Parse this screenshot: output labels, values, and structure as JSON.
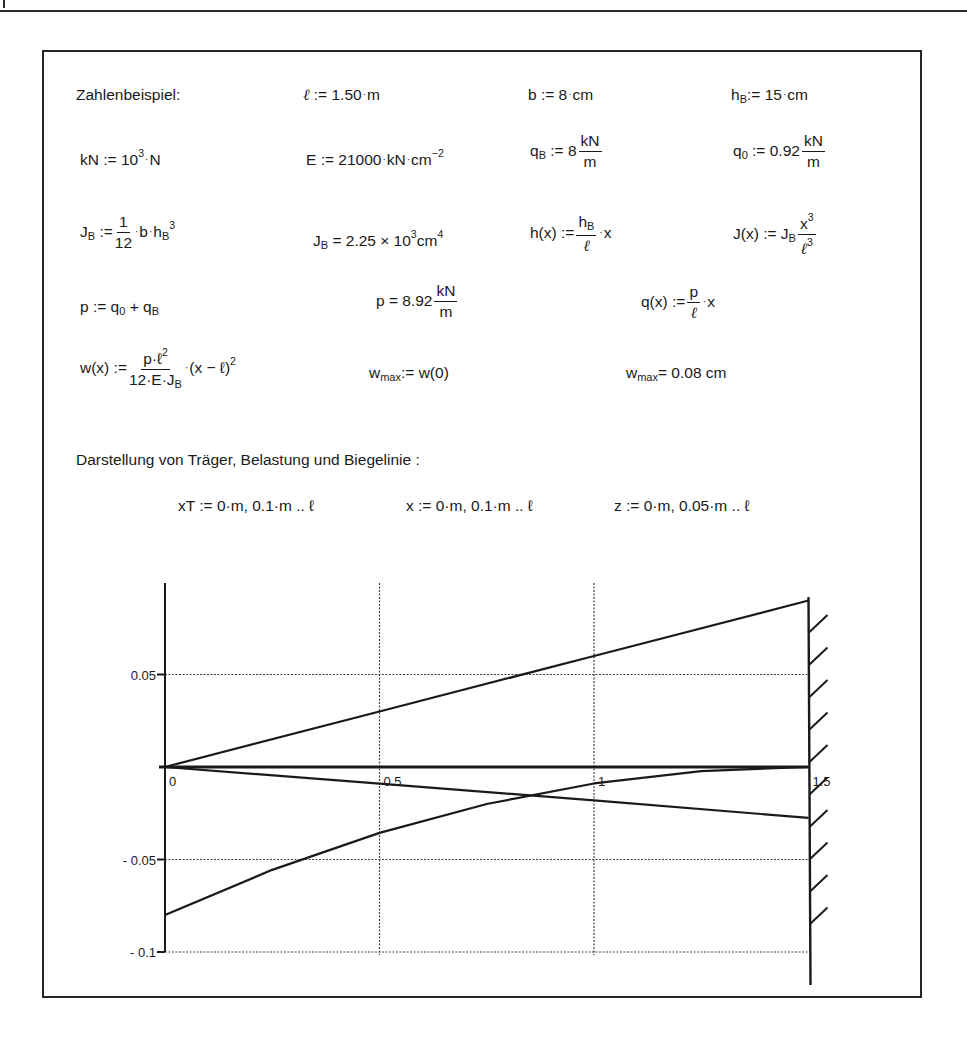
{
  "page": {
    "section_title": "Zahlenbeispiel:",
    "plot_heading": "Darstellung von Träger, Belastung und Biegelinie :"
  },
  "definitions": {
    "ell": {
      "lhs": "ℓ",
      "op": ":=",
      "value": "1.50",
      "unit": "m"
    },
    "b": {
      "lhs": "b",
      "op": ":=",
      "value": "8",
      "unit": "cm"
    },
    "hB": {
      "lhs": "h",
      "sub": "B",
      "op": ":=",
      "value": "15",
      "unit": "cm"
    },
    "kN": {
      "lhs": "kN",
      "op": ":=",
      "base": "10",
      "exp": "3",
      "unit": "N"
    },
    "E": {
      "lhs": "E",
      "op": ":=",
      "value": "21000",
      "unit": "kN",
      "unit2": "cm",
      "unit2_exp": "−2"
    },
    "qB": {
      "lhs": "q",
      "sub": "B",
      "op": ":=",
      "value": "8",
      "num": "kN",
      "den": "m"
    },
    "q0": {
      "lhs": "q",
      "sub": "0",
      "op": ":=",
      "value": "0.92",
      "num": "kN",
      "den": "m"
    },
    "JB_def": {
      "lhs": "J",
      "sub": "B",
      "op": ":=",
      "num": "1",
      "den": "12",
      "rest_b": "b",
      "rest_h": "h",
      "rest_sub": "B",
      "rest_exp": "3"
    },
    "JB_res": {
      "lhs": "J",
      "sub": "B",
      "op": "=",
      "value": "2.25 × 10",
      "exp": "3",
      "unit": "cm",
      "unit_exp": "4"
    },
    "h_x": {
      "lhs": "h(x)",
      "op": ":=",
      "num": "h",
      "num_sub": "B",
      "den": "ℓ",
      "tail": "x"
    },
    "J_x": {
      "lhs": "J(x)",
      "op": ":=",
      "pre": "J",
      "pre_sub": "B",
      "num": "x",
      "num_exp": "3",
      "den": "ℓ",
      "den_exp": "3"
    },
    "p_def": {
      "lhs": "p",
      "op": ":=",
      "rhs": "q",
      "rhs_sub1": "0",
      "plus": "+",
      "rhs2": "q",
      "rhs_sub2": "B"
    },
    "p_res": {
      "lhs": "p",
      "op": "=",
      "value": "8.92",
      "num": "kN",
      "den": "m"
    },
    "q_x": {
      "lhs": "q(x)",
      "op": ":=",
      "num": "p",
      "den": "ℓ",
      "tail": "x"
    },
    "w_x": {
      "lhs": "w(x)",
      "op": ":=",
      "num": "p·ℓ",
      "num_exp": "2",
      "den": "12·E·J",
      "den_sub": "B",
      "tail": "(x − ℓ)",
      "tail_exp": "2"
    },
    "wmax_def": {
      "lhs": "w",
      "sub": "max",
      "op": ":=",
      "rhs": "w(0)"
    },
    "wmax_res": {
      "lhs": "w",
      "sub": "max",
      "op": "=",
      "value": "0.08",
      "unit": "cm"
    },
    "ranges": [
      {
        "text": "xT := 0·m, 0.1·m .. ℓ"
      },
      {
        "text": "x := 0·m, 0.1·m .. ℓ"
      },
      {
        "text": "z := 0·m, 0.05·m .. ℓ"
      }
    ]
  },
  "chart_data": {
    "type": "line",
    "title": "",
    "xlabel": "",
    "ylabel": "",
    "xlim": [
      0,
      1.5
    ],
    "ylim": [
      -0.1,
      0.1
    ],
    "x_ticks": [
      0,
      0.5,
      1,
      1.5
    ],
    "x_tick_labels": [
      "0",
      "0.5",
      "1",
      "1.5"
    ],
    "y_ticks": [
      0.05,
      -0.05,
      -0.1
    ],
    "y_tick_labels": [
      "0.05",
      "- 0.05",
      "- 0.1"
    ],
    "grid": true,
    "grid_style": "dotted",
    "series": [
      {
        "name": "beam-top (h(x) scaled)",
        "x": [
          0,
          0.5,
          1.0,
          1.5
        ],
        "y": [
          0,
          0.03,
          0.06,
          0.09
        ]
      },
      {
        "name": "beam-axis",
        "x": [
          0,
          1.5
        ],
        "y": [
          0,
          0
        ]
      },
      {
        "name": "load q(x) scaled",
        "x": [
          0,
          0.5,
          1.0,
          1.5
        ],
        "y": [
          0,
          -0.009,
          -0.018,
          -0.0275
        ]
      },
      {
        "name": "deflection -w(x)",
        "x": [
          0,
          0.25,
          0.5,
          0.75,
          1.0,
          1.25,
          1.5
        ],
        "y": [
          -0.08,
          -0.0556,
          -0.0356,
          -0.02,
          -0.0089,
          -0.0022,
          0
        ]
      }
    ],
    "support": {
      "type": "fixed-wall",
      "x": 1.5,
      "hatch_count": 10
    }
  }
}
